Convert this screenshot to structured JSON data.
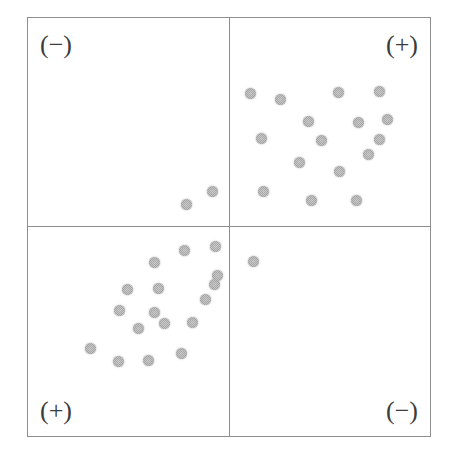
{
  "figure": {
    "background_color": "#ffffff",
    "frame_color": "#8e8e8e",
    "point_color": "#a9a9a9",
    "label_color": "#3c3c3c"
  },
  "quadrant_labels": {
    "top_left": "(−)",
    "top_right": "(+)",
    "bottom_left": "(+)",
    "bottom_right": "(−)"
  },
  "chart_data": {
    "type": "scatter",
    "title": "",
    "xlabel": "",
    "ylabel": "",
    "xlim": [
      -1,
      1
    ],
    "ylim": [
      -1,
      1
    ],
    "grid": false,
    "legend": null,
    "axes": {
      "vertical_axis_at_x": 0,
      "horizontal_axis_at_y": 0,
      "frame": true
    },
    "quadrant_signs": {
      "upper_left": "(−)",
      "upper_right": "(+)",
      "lower_left": "(+)",
      "lower_right": "(−)"
    },
    "point_count": 36,
    "series": [
      {
        "name": "observations",
        "marker": "circle",
        "color": "#a9a9a9",
        "size_px": 11,
        "points_px": [
          [
            185,
            203
          ],
          [
            211,
            190
          ],
          [
            249,
            92
          ],
          [
            279,
            98
          ],
          [
            337,
            91
          ],
          [
            378,
            90
          ],
          [
            307,
            120
          ],
          [
            357,
            121
          ],
          [
            386,
            118
          ],
          [
            260,
            137
          ],
          [
            320,
            139
          ],
          [
            378,
            138
          ],
          [
            298,
            161
          ],
          [
            367,
            153
          ],
          [
            338,
            170
          ],
          [
            262,
            190
          ],
          [
            310,
            199
          ],
          [
            355,
            199
          ],
          [
            183,
            249
          ],
          [
            214,
            245
          ],
          [
            153,
            261
          ],
          [
            126,
            288
          ],
          [
            157,
            287
          ],
          [
            213,
            283
          ],
          [
            216,
            274
          ],
          [
            118,
            309
          ],
          [
            204,
            298
          ],
          [
            137,
            327
          ],
          [
            163,
            322
          ],
          [
            191,
            321
          ],
          [
            89,
            347
          ],
          [
            180,
            352
          ],
          [
            117,
            360
          ],
          [
            147,
            359
          ],
          [
            252,
            260
          ],
          [
            153,
            311
          ]
        ]
      }
    ]
  }
}
